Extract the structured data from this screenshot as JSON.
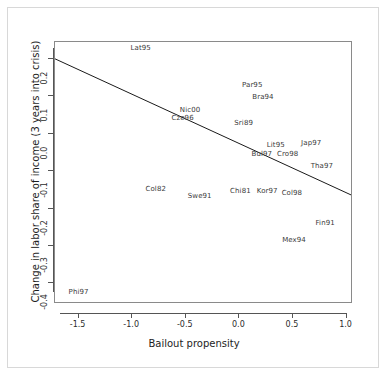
{
  "chart_data": {
    "type": "scatter",
    "title": "",
    "xlabel": "Bailout propensity",
    "ylabel": "Change in labor share of income (3 years into crisis)",
    "xlim": [
      -1.72,
      1.06
    ],
    "ylim": [
      -0.455,
      0.245
    ],
    "xticks": [
      "-1.5",
      "-1.0",
      "-0.5",
      "0.0",
      "0.5",
      "1.0"
    ],
    "xtick_values": [
      -1.5,
      -1.0,
      -0.5,
      0.0,
      0.5,
      1.0
    ],
    "yticks": [
      "0.2",
      "0.1",
      "0.0",
      "-0.1",
      "-0.2",
      "-0.3",
      "-0.4"
    ],
    "ytick_values": [
      0.2,
      0.1,
      0.0,
      -0.1,
      -0.2,
      -0.3,
      -0.4
    ],
    "grid": false,
    "legend": "none",
    "marker_style": "text-labels-only",
    "points": [
      {
        "label": "Lat95",
        "x": -0.92,
        "y": 0.228
      },
      {
        "label": "Par95",
        "x": 0.12,
        "y": 0.131
      },
      {
        "label": "Bra94",
        "x": 0.22,
        "y": 0.098
      },
      {
        "label": "Nic00",
        "x": -0.46,
        "y": 0.062
      },
      {
        "label": "Cze96",
        "x": -0.53,
        "y": 0.043
      },
      {
        "label": "Sri89",
        "x": 0.04,
        "y": 0.028
      },
      {
        "label": "Lit95",
        "x": 0.34,
        "y": -0.029
      },
      {
        "label": "Jap97",
        "x": 0.67,
        "y": -0.024
      },
      {
        "label": "Bul97",
        "x": 0.21,
        "y": -0.053
      },
      {
        "label": "Cro98",
        "x": 0.45,
        "y": -0.055
      },
      {
        "label": "Tha97",
        "x": 0.77,
        "y": -0.087
      },
      {
        "label": "Col82",
        "x": -0.78,
        "y": -0.148
      },
      {
        "label": "Swe91",
        "x": -0.37,
        "y": -0.166
      },
      {
        "label": "Chi81",
        "x": 0.01,
        "y": -0.152
      },
      {
        "label": "Kor97",
        "x": 0.26,
        "y": -0.154
      },
      {
        "label": "Col98",
        "x": 0.49,
        "y": -0.158
      },
      {
        "label": "Fin91",
        "x": 0.8,
        "y": -0.238
      },
      {
        "label": "Mex94",
        "x": 0.51,
        "y": -0.283
      },
      {
        "label": "Phi97",
        "x": -1.5,
        "y": -0.424
      }
    ],
    "fit_line": {
      "style": "solid",
      "color": "#1a1a1a",
      "x_start": -1.72,
      "y_start": 0.2,
      "x_end": 1.06,
      "y_end": -0.166
    }
  }
}
